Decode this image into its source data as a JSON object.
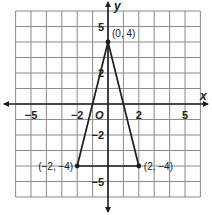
{
  "chart_data": {
    "type": "scatter",
    "title": "",
    "xlabel": "x",
    "ylabel": "y",
    "xlim": [
      -6,
      6
    ],
    "ylim": [
      -6,
      6
    ],
    "grid": true,
    "origin_label": "O",
    "x_tick_labels": [
      {
        "value": -5,
        "label": "−5"
      },
      {
        "value": -2,
        "label": "−2"
      },
      {
        "value": 2,
        "label": "2"
      },
      {
        "value": 5,
        "label": "5"
      }
    ],
    "y_tick_labels": [
      {
        "value": 5,
        "label": "5"
      },
      {
        "value": 2,
        "label": "2"
      },
      {
        "value": -2,
        "label": "−2"
      },
      {
        "value": -5,
        "label": "−5"
      }
    ],
    "series": [
      {
        "name": "triangle",
        "closed": true,
        "points": [
          {
            "x": 0,
            "y": 4,
            "label": "(0, 4)"
          },
          {
            "x": 2,
            "y": -4,
            "label": "(2, −4)"
          },
          {
            "x": -2,
            "y": -4,
            "label": "(−2, −4)"
          }
        ]
      }
    ]
  },
  "colors": {
    "grid": "#8c8c8c",
    "axis": "#1e1e1e",
    "shape": "#1e1e1e"
  }
}
